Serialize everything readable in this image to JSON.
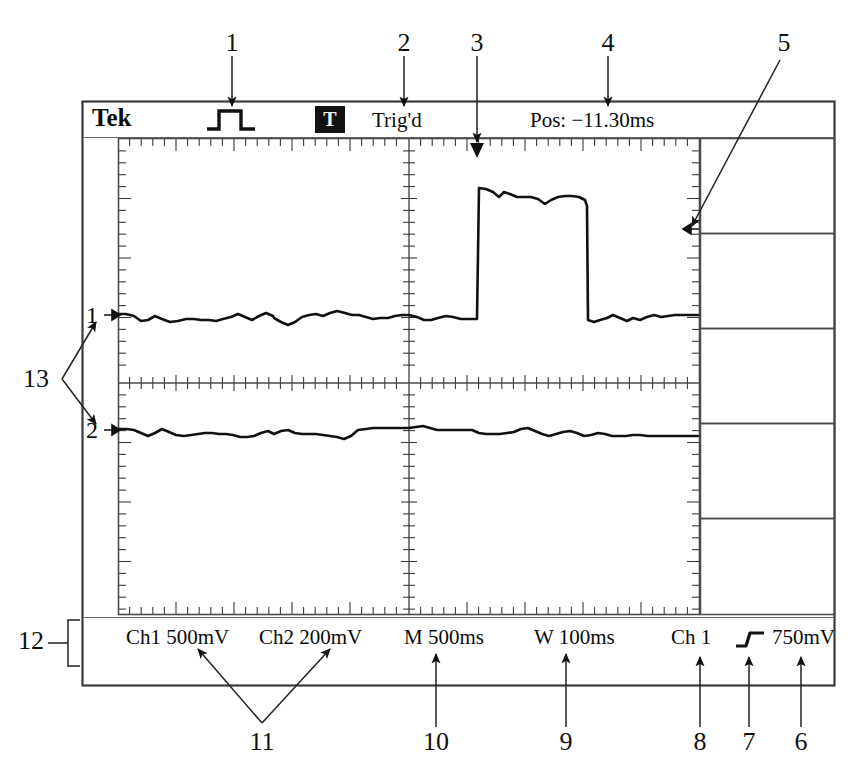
{
  "figure": {
    "type": "oscilloscope-display-diagram"
  },
  "scope": {
    "brand": "Tek",
    "trigger_icon": "pulse-waveform-icon",
    "trigger_badge": "T",
    "trigger_state": "Trig'd",
    "position_readout": "Pos: −11.30ms",
    "channel_markers": [
      {
        "label": "1"
      },
      {
        "label": "2"
      }
    ],
    "readouts": [
      {
        "name": "ch1-vertical-scale",
        "label": "Ch1  500mV"
      },
      {
        "name": "ch2-vertical-scale",
        "label": "Ch2  200mV"
      },
      {
        "name": "main-timebase",
        "label": "M 500ms"
      },
      {
        "name": "window-timebase",
        "label": "W 100ms"
      },
      {
        "name": "trigger-source",
        "label": "Ch 1"
      },
      {
        "name": "trigger-slope",
        "label": "rising-edge-icon"
      },
      {
        "name": "trigger-level",
        "label": "750mV"
      }
    ],
    "side_menu_buttons": [
      "",
      "",
      "",
      "",
      ""
    ]
  },
  "callouts": [
    {
      "id": "1",
      "x": 232,
      "y": 43,
      "target": "trigger-waveform-icon"
    },
    {
      "id": "2",
      "x": 404,
      "y": 43,
      "target": "trig-d-status"
    },
    {
      "id": "3",
      "x": 477,
      "y": 43,
      "target": "trigger-position-marker"
    },
    {
      "id": "4",
      "x": 608,
      "y": 43,
      "target": "position-readout"
    },
    {
      "id": "5",
      "x": 784,
      "y": 43,
      "target": "trigger-level-marker"
    },
    {
      "id": "6",
      "x": 801,
      "y": 742,
      "target": "trigger-level-readout"
    },
    {
      "id": "7",
      "x": 749,
      "y": 742,
      "target": "trigger-slope-icon"
    },
    {
      "id": "8",
      "x": 700,
      "y": 742,
      "target": "trigger-source-readout"
    },
    {
      "id": "9",
      "x": 566,
      "y": 742,
      "target": "window-timebase-readout"
    },
    {
      "id": "10",
      "x": 436,
      "y": 742,
      "target": "main-timebase-readout"
    },
    {
      "id": "11",
      "x": 262,
      "y": 742,
      "target": "channel-scale-readouts"
    },
    {
      "id": "12",
      "x": 31,
      "y": 641,
      "target": "readout-bar"
    },
    {
      "id": "13",
      "x": 36,
      "y": 379,
      "target": "channel-ground-markers"
    }
  ],
  "chart_data": {
    "type": "line",
    "xlabel": "Time",
    "ylabel": "Voltage",
    "grid": true,
    "divisions": {
      "horizontal": 10,
      "vertical": 8
    },
    "series": [
      {
        "name": "Ch1",
        "volts_per_div": "500mV",
        "ground_level_px": 315,
        "points": [
          [
            118,
            314
          ],
          [
            126,
            314
          ],
          [
            134,
            316
          ],
          [
            141,
            321
          ],
          [
            148,
            320
          ],
          [
            155,
            316
          ],
          [
            162,
            319
          ],
          [
            170,
            322
          ],
          [
            178,
            321
          ],
          [
            186,
            319
          ],
          [
            194,
            319
          ],
          [
            201,
            320
          ],
          [
            209,
            320
          ],
          [
            216,
            321
          ],
          [
            223,
            319
          ],
          [
            231,
            317
          ],
          [
            238,
            314
          ],
          [
            245,
            317
          ],
          [
            252,
            320
          ],
          [
            259,
            316
          ],
          [
            266,
            313
          ],
          [
            273,
            316
          ],
          [
            274,
            318
          ],
          [
            281,
            322
          ],
          [
            288,
            325
          ],
          [
            295,
            322
          ],
          [
            302,
            317
          ],
          [
            309,
            315
          ],
          [
            316,
            314
          ],
          [
            323,
            316
          ],
          [
            330,
            313
          ],
          [
            337,
            311
          ],
          [
            345,
            313
          ],
          [
            352,
            315
          ],
          [
            359,
            315
          ],
          [
            366,
            317
          ],
          [
            373,
            319
          ],
          [
            380,
            318
          ],
          [
            388,
            318
          ],
          [
            395,
            316
          ],
          [
            402,
            315
          ],
          [
            409,
            315
          ],
          [
            417,
            317
          ],
          [
            424,
            320
          ],
          [
            431,
            320
          ],
          [
            438,
            318
          ],
          [
            446,
            316
          ],
          [
            453,
            317
          ],
          [
            461,
            319
          ],
          [
            468,
            319
          ],
          [
            474,
            319
          ],
          [
            477,
            319
          ],
          [
            479,
            188
          ],
          [
            486,
            189
          ],
          [
            493,
            192
          ],
          [
            499,
            197
          ],
          [
            504,
            192
          ],
          [
            510,
            194
          ],
          [
            517,
            197
          ],
          [
            524,
            197
          ],
          [
            531,
            197
          ],
          [
            538,
            199
          ],
          [
            545,
            204
          ],
          [
            551,
            200
          ],
          [
            558,
            197
          ],
          [
            565,
            196
          ],
          [
            572,
            196
          ],
          [
            579,
            197
          ],
          [
            585,
            200
          ],
          [
            587,
            206
          ],
          [
            588,
            320
          ],
          [
            594,
            322
          ],
          [
            600,
            320
          ],
          [
            607,
            318
          ],
          [
            613,
            315
          ],
          [
            620,
            318
          ],
          [
            627,
            321
          ],
          [
            633,
            318
          ],
          [
            640,
            320
          ],
          [
            647,
            317
          ],
          [
            654,
            315
          ],
          [
            661,
            317
          ],
          [
            668,
            316
          ],
          [
            675,
            315
          ],
          [
            682,
            315
          ],
          [
            690,
            315
          ],
          [
            698,
            315
          ]
        ]
      },
      {
        "name": "Ch2",
        "volts_per_div": "200mV",
        "ground_level_px": 430,
        "points": [
          [
            118,
            429
          ],
          [
            126,
            429
          ],
          [
            134,
            430
          ],
          [
            141,
            433
          ],
          [
            148,
            436
          ],
          [
            155,
            433
          ],
          [
            162,
            429
          ],
          [
            169,
            432
          ],
          [
            176,
            435
          ],
          [
            184,
            436
          ],
          [
            191,
            435
          ],
          [
            198,
            434
          ],
          [
            205,
            433
          ],
          [
            212,
            433
          ],
          [
            219,
            434
          ],
          [
            226,
            434
          ],
          [
            233,
            435
          ],
          [
            240,
            437
          ],
          [
            247,
            437
          ],
          [
            254,
            436
          ],
          [
            261,
            433
          ],
          [
            268,
            431
          ],
          [
            274,
            434
          ],
          [
            281,
            431
          ],
          [
            288,
            430
          ],
          [
            295,
            433
          ],
          [
            302,
            434
          ],
          [
            309,
            434
          ],
          [
            316,
            434
          ],
          [
            323,
            435
          ],
          [
            330,
            436
          ],
          [
            337,
            437
          ],
          [
            344,
            439
          ],
          [
            351,
            436
          ],
          [
            358,
            430
          ],
          [
            366,
            429
          ],
          [
            373,
            428
          ],
          [
            380,
            428
          ],
          [
            388,
            428
          ],
          [
            395,
            428
          ],
          [
            402,
            428
          ],
          [
            409,
            428
          ],
          [
            416,
            427
          ],
          [
            423,
            426
          ],
          [
            430,
            428
          ],
          [
            437,
            430
          ],
          [
            444,
            430
          ],
          [
            451,
            430
          ],
          [
            458,
            430
          ],
          [
            465,
            430
          ],
          [
            472,
            430
          ],
          [
            479,
            433
          ],
          [
            486,
            434
          ],
          [
            493,
            434
          ],
          [
            500,
            434
          ],
          [
            507,
            433
          ],
          [
            514,
            432
          ],
          [
            521,
            429
          ],
          [
            528,
            428
          ],
          [
            535,
            431
          ],
          [
            542,
            434
          ],
          [
            549,
            436
          ],
          [
            556,
            434
          ],
          [
            563,
            432
          ],
          [
            570,
            431
          ],
          [
            577,
            433
          ],
          [
            584,
            436
          ],
          [
            591,
            435
          ],
          [
            598,
            433
          ],
          [
            605,
            434
          ],
          [
            612,
            436
          ],
          [
            619,
            436
          ],
          [
            626,
            436
          ],
          [
            633,
            435
          ],
          [
            640,
            435
          ],
          [
            648,
            436
          ],
          [
            655,
            436
          ],
          [
            662,
            436
          ],
          [
            670,
            436
          ],
          [
            678,
            436
          ],
          [
            686,
            436
          ],
          [
            694,
            436
          ],
          [
            698,
            436
          ]
        ]
      }
    ],
    "markers": {
      "trigger_position_x_px": 477,
      "trigger_level_y_px": 229
    }
  }
}
